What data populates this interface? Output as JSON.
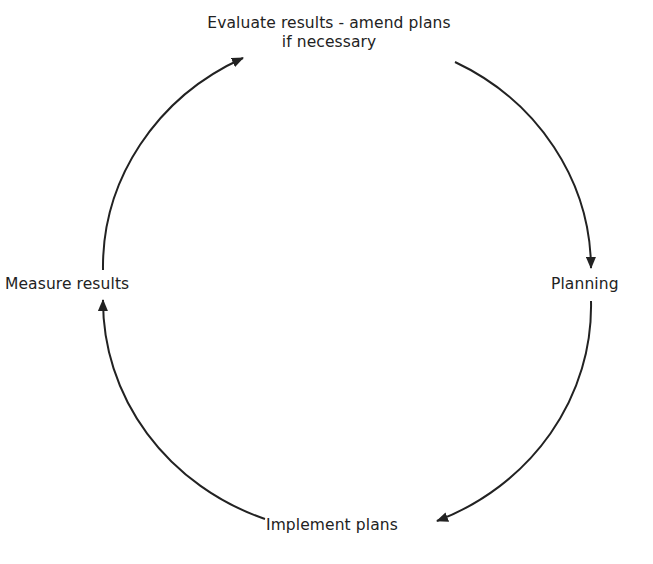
{
  "diagram": {
    "type": "cycle",
    "direction": "clockwise",
    "stroke_color": "#222222",
    "background": "#ffffff",
    "nodes": [
      {
        "id": "evaluate",
        "line1": "Evaluate results - amend plans",
        "line2": "if necessary",
        "position": "top"
      },
      {
        "id": "planning",
        "label": "Planning",
        "position": "right"
      },
      {
        "id": "implement",
        "label": "Implement plans",
        "position": "bottom"
      },
      {
        "id": "measure",
        "label": "Measure results",
        "position": "left"
      }
    ],
    "edges": [
      {
        "from": "evaluate",
        "to": "planning"
      },
      {
        "from": "planning",
        "to": "implement"
      },
      {
        "from": "implement",
        "to": "measure"
      },
      {
        "from": "measure",
        "to": "evaluate"
      }
    ]
  }
}
